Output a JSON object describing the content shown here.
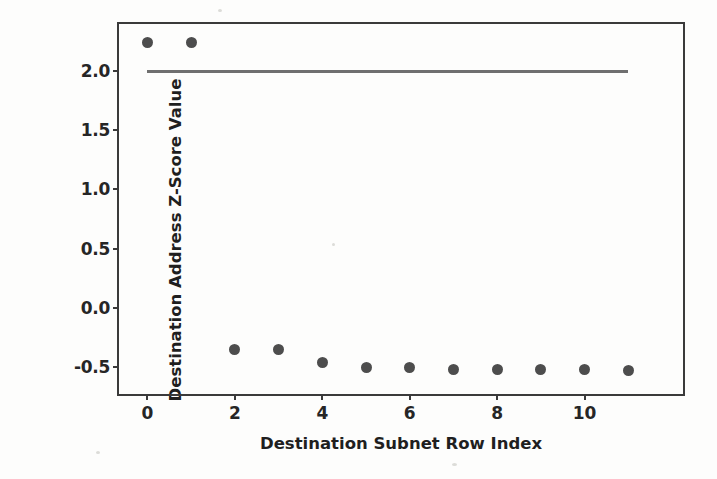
{
  "chart_data": {
    "type": "scatter",
    "title": "",
    "xlabel": "Destination Subnet Row Index",
    "ylabel": "Destination Address Z-Score Value",
    "x": [
      0,
      1,
      2,
      3,
      4,
      5,
      6,
      7,
      8,
      9,
      10,
      11
    ],
    "values": [
      2.24,
      2.24,
      -0.35,
      -0.35,
      -0.46,
      -0.51,
      -0.51,
      -0.52,
      -0.52,
      -0.52,
      -0.52,
      -0.53
    ],
    "series": [
      {
        "name": "Destination Address Z-Score Value",
        "values": [
          2.24,
          2.24,
          -0.35,
          -0.35,
          -0.46,
          -0.51,
          -0.51,
          -0.52,
          -0.52,
          -0.52,
          -0.52,
          -0.53
        ],
        "marker": "circle",
        "color": "#4d4d4d"
      }
    ],
    "threshold_line": {
      "label": "",
      "y": 2.0,
      "x_start": 0,
      "x_end": 11,
      "color": "#6f6f6f"
    },
    "xticks": [
      "0",
      "2",
      "4",
      "6",
      "8",
      "10"
    ],
    "xtick_values": [
      0,
      2,
      4,
      6,
      8,
      10
    ],
    "yticks": [
      "2.0",
      "1.5",
      "1.0",
      "0.5",
      "0.0",
      "-0.5"
    ],
    "ytick_values": [
      2.0,
      1.5,
      1.0,
      0.5,
      0.0,
      -0.5
    ],
    "xlim": [
      -0.65,
      12.25
    ],
    "ylim": [
      -0.73,
      2.4
    ],
    "grid": false,
    "legend": "none",
    "frame": "box",
    "background_color": "#fdfdfc",
    "axis_color": "#3a3a3a"
  }
}
